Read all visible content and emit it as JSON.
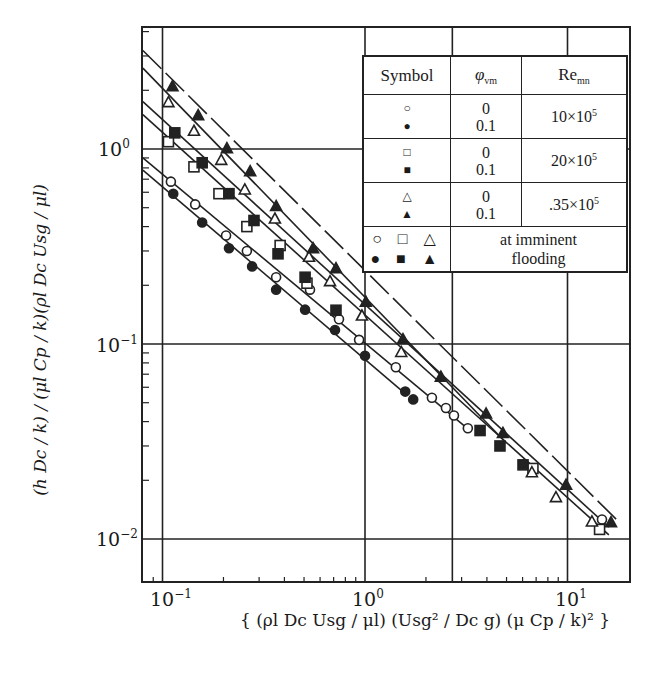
{
  "chart_data": {
    "type": "scatter",
    "scale": {
      "x": "log",
      "y": "log"
    },
    "title": "",
    "xlabel": "{ (ρl Dc Usg / μl) (Usg² / Dc g) (μ Cp / k)² }",
    "ylabel": "(h Dc / k) / (μl Cp / k)(ρl Dc Usg / μl)",
    "xlim": [
      0.08,
      20
    ],
    "ylim": [
      0.006,
      4.5
    ],
    "x_ticks": [
      "10^-1",
      "10^0",
      "10^1"
    ],
    "y_ticks": [
      "10^-2",
      "10^-1",
      "10^0"
    ],
    "grid": true,
    "grid_x": [
      0.1,
      1,
      2.7,
      10
    ],
    "grid_y": [
      0.01,
      0.1,
      1
    ],
    "legend_position": "upper right (table)",
    "legend": {
      "headers": [
        "Symbol",
        "φvm",
        "Remn"
      ],
      "rows": [
        {
          "symbols": [
            "○",
            "●"
          ],
          "phi": [
            "0",
            "0.1"
          ],
          "re": "10×10^5"
        },
        {
          "symbols": [
            "□",
            "■"
          ],
          "phi": [
            "0",
            "0.1"
          ],
          "re": "20×10^5"
        },
        {
          "symbols": [
            "△",
            "▲"
          ],
          "phi": [
            "0",
            "0.1"
          ],
          "re": ".35×10^5"
        }
      ],
      "flooding_symbols": [
        "○",
        "□",
        "△",
        "●",
        "■",
        "▲"
      ],
      "flooding_label": "at imminent flooding"
    },
    "series": [
      {
        "name": "○ φvm=0, Re=10×10^5",
        "marker": "circle-open",
        "x": [
          0.11,
          0.145,
          0.206,
          0.261,
          0.364,
          0.535,
          0.744,
          0.935,
          1.42,
          2.14,
          2.51,
          2.75,
          3.22,
          14.8
        ],
        "y": [
          0.68,
          0.52,
          0.36,
          0.3,
          0.22,
          0.19,
          0.134,
          0.105,
          0.076,
          0.053,
          0.047,
          0.043,
          0.037,
          0.0126
        ]
      },
      {
        "name": "● φvm=0.1, Re=10×10^5",
        "marker": "circle-filled",
        "x": [
          0.113,
          0.157,
          0.213,
          0.277,
          0.364,
          0.506,
          0.711,
          1.0,
          1.58,
          1.73
        ],
        "y": [
          0.59,
          0.42,
          0.31,
          0.25,
          0.19,
          0.15,
          0.118,
          0.087,
          0.057,
          0.052
        ]
      },
      {
        "name": "□ φvm=0, Re=20×10^5",
        "marker": "square-open",
        "x": [
          0.107,
          0.143,
          0.19,
          0.261,
          0.381,
          0.517,
          6.75,
          14.4
        ],
        "y": [
          1.09,
          0.81,
          0.59,
          0.4,
          0.32,
          0.205,
          0.023,
          0.0112
        ]
      },
      {
        "name": "■ φvm=0.1, Re=20×10^5",
        "marker": "square-filled",
        "x": [
          0.115,
          0.157,
          0.213,
          0.283,
          0.372,
          0.506,
          0.719,
          3.7,
          4.64,
          6.03
        ],
        "y": [
          1.21,
          0.85,
          0.59,
          0.43,
          0.29,
          0.22,
          0.149,
          0.036,
          0.03,
          0.024
        ]
      },
      {
        "name": "△ φvm=0, Re=.35×10^5",
        "marker": "triangle-open",
        "x": [
          0.107,
          0.143,
          0.195,
          0.255,
          0.359,
          0.529,
          0.672,
          0.966,
          1.51,
          6.67,
          8.77,
          13.2
        ],
        "y": [
          1.74,
          1.24,
          0.88,
          0.62,
          0.44,
          0.28,
          0.21,
          0.14,
          0.091,
          0.022,
          0.0164,
          0.0123
        ]
      },
      {
        "name": "▲ φvm=0.1, Re=.35×10^5",
        "marker": "triangle-filled",
        "x": [
          0.112,
          0.15,
          0.208,
          0.271,
          0.364,
          0.554,
          0.719,
          1.01,
          1.54,
          2.37,
          3.96,
          4.8,
          9.84,
          16.4
        ],
        "y": [
          2.1,
          1.49,
          1.01,
          0.77,
          0.51,
          0.31,
          0.245,
          0.165,
          0.106,
          0.068,
          0.044,
          0.035,
          0.019,
          0.0122
        ]
      }
    ],
    "fit_lines": [
      {
        "style": "solid",
        "x": [
          0.08,
          1.6
        ],
        "y": [
          0.78,
          0.055
        ]
      },
      {
        "style": "solid",
        "x": [
          0.08,
          3.3
        ],
        "y": [
          0.9,
          0.036
        ]
      },
      {
        "style": "solid",
        "x": [
          0.08,
          16
        ],
        "y": [
          1.5,
          0.0105
        ]
      },
      {
        "style": "solid",
        "x": [
          0.08,
          16
        ],
        "y": [
          1.75,
          0.0115
        ]
      },
      {
        "style": "solid",
        "x": [
          0.08,
          5
        ],
        "y": [
          2.6,
          0.031
        ]
      },
      {
        "style": "dashed",
        "x": [
          0.08,
          18
        ],
        "y": [
          3.2,
          0.0122
        ]
      }
    ]
  },
  "axes": {
    "x_tick_labels": [
      {
        "base": "10",
        "exp": "−1"
      },
      {
        "base": "10",
        "exp": "0"
      },
      {
        "base": "10",
        "exp": "1"
      }
    ],
    "y_tick_labels": [
      {
        "base": "10",
        "exp": "0"
      },
      {
        "base": "10",
        "exp": "−1"
      },
      {
        "base": "10",
        "exp": "−2"
      }
    ]
  },
  "legend_table": {
    "header_symbol": "Symbol",
    "header_phi": "φ",
    "header_phi_sub": "vm",
    "header_re": "Re",
    "header_re_sub": "mn",
    "row1_sym_open": "○",
    "row1_sym_filled": "●",
    "row1_phi0": "0",
    "row1_phi1": "0.1",
    "row1_re": "10×10",
    "row1_re_exp": "5",
    "row2_sym_open": "□",
    "row2_sym_filled": "■",
    "row2_phi0": "0",
    "row2_phi1": "0.1",
    "row2_re": "20×10",
    "row2_re_exp": "5",
    "row3_sym_open": "△",
    "row3_sym_filled": "▲",
    "row3_phi0": "0",
    "row3_phi1": "0.1",
    "row3_re": ".35×10",
    "row3_re_exp": "5",
    "flood_open": "○ □ △",
    "flood_filled": "● ■ ▲",
    "flood_label_1": "at imminent",
    "flood_label_2": "flooding"
  }
}
